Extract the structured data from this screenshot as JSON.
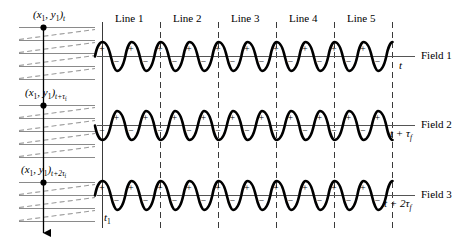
{
  "diagram": {
    "line_headers": [
      "Line 1",
      "Line 2",
      "Line 3",
      "Line 4",
      "Line 5"
    ],
    "field_labels": [
      "Field 1",
      "Field 2",
      "Field 3"
    ],
    "axis_labels": [
      "t",
      "t + τf",
      "t + 2τf"
    ],
    "raster_labels": [
      "(x1, y1)t",
      "(x1, y1)t+τf",
      "(x1, y1)t+2τf"
    ],
    "origin_label": "t1",
    "polarity_plus": "+",
    "polarity_minus": "−",
    "cycles_per_line": 2,
    "scan_lines_per_panel": 5,
    "retrace_lines_per_panel": 4,
    "colors": {
      "ink": "#000000",
      "scanline": "#8a8a8a",
      "retrace": "#9a9a9a",
      "divider": "#3a3a3a"
    }
  },
  "chart_data": {
    "type": "line",
    "xlabel": "time",
    "ylabel": "signal polarity",
    "series": [
      {
        "name": "Field 1",
        "phase": "peak-start",
        "cycles": 10,
        "axis_label": "t"
      },
      {
        "name": "Field 2",
        "phase": "trough-start",
        "cycles": 10,
        "axis_label": "t + τf"
      },
      {
        "name": "Field 3",
        "phase": "peak-start",
        "cycles": 10,
        "axis_label": "t + 2τf"
      }
    ],
    "categories": [
      "Line 1",
      "Line 2",
      "Line 3",
      "Line 4",
      "Line 5"
    ]
  }
}
